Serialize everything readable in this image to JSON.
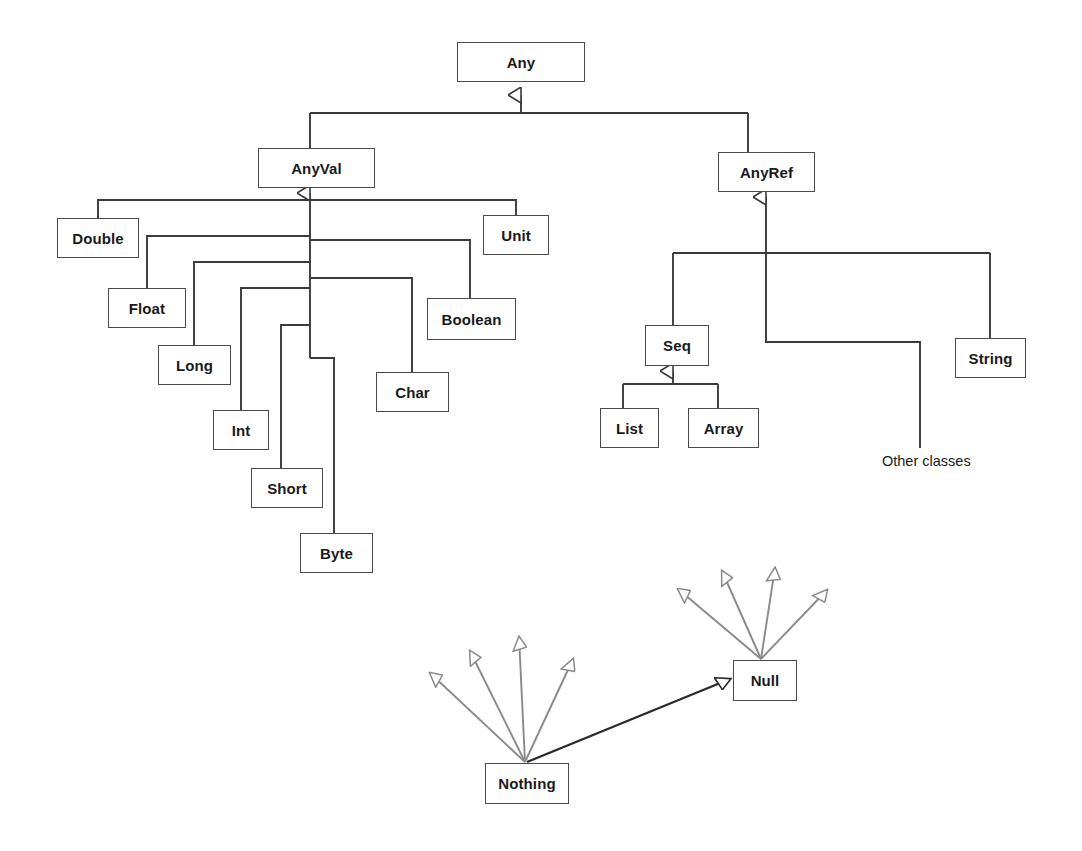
{
  "diagram": {
    "background_color": "#ffffff",
    "edge_color": "#3a3a3a",
    "subtype_edge_color": "#8a8a8a",
    "node_border_color": "#4a4a4a",
    "node_fill_color": "#ffffff",
    "text_color": "#1a1a1a"
  },
  "nodes": {
    "any": {
      "label": "Any",
      "x": 457,
      "y": 42,
      "w": 128,
      "h": 40
    },
    "anyval": {
      "label": "AnyVal",
      "x": 258,
      "y": 148,
      "w": 117,
      "h": 40
    },
    "anyref": {
      "label": "AnyRef",
      "x": 718,
      "y": 152,
      "w": 97,
      "h": 40
    },
    "double": {
      "label": "Double",
      "x": 57,
      "y": 218,
      "w": 82,
      "h": 40
    },
    "float": {
      "label": "Float",
      "x": 108,
      "y": 288,
      "w": 78,
      "h": 40
    },
    "long": {
      "label": "Long",
      "x": 158,
      "y": 345,
      "w": 73,
      "h": 40
    },
    "int": {
      "label": "Int",
      "x": 213,
      "y": 410,
      "w": 56,
      "h": 40
    },
    "short": {
      "label": "Short",
      "x": 251,
      "y": 468,
      "w": 72,
      "h": 40
    },
    "byte": {
      "label": "Byte",
      "x": 300,
      "y": 533,
      "w": 73,
      "h": 40
    },
    "char": {
      "label": "Char",
      "x": 376,
      "y": 372,
      "w": 73,
      "h": 40
    },
    "boolean": {
      "label": "Boolean",
      "x": 427,
      "y": 298,
      "w": 89,
      "h": 42
    },
    "unit": {
      "label": "Unit",
      "x": 483,
      "y": 215,
      "w": 66,
      "h": 40
    },
    "seq": {
      "label": "Seq",
      "x": 645,
      "y": 325,
      "w": 64,
      "h": 41
    },
    "list": {
      "label": "List",
      "x": 600,
      "y": 408,
      "w": 59,
      "h": 40
    },
    "array": {
      "label": "Array",
      "x": 688,
      "y": 408,
      "w": 71,
      "h": 40
    },
    "string": {
      "label": "String",
      "x": 955,
      "y": 338,
      "w": 71,
      "h": 40
    },
    "null": {
      "label": "Null",
      "x": 733,
      "y": 660,
      "w": 64,
      "h": 41
    },
    "nothing": {
      "label": "Nothing",
      "x": 485,
      "y": 763,
      "w": 84,
      "h": 41
    }
  },
  "labels": {
    "other_classes": {
      "text": "Other classes",
      "x": 882,
      "y": 453
    }
  },
  "hierarchy": {
    "root": "Any",
    "edges": [
      {
        "from": "AnyVal",
        "to": "Any",
        "kind": "extends"
      },
      {
        "from": "AnyRef",
        "to": "Any",
        "kind": "extends"
      },
      {
        "from": "Double",
        "to": "AnyVal",
        "kind": "extends"
      },
      {
        "from": "Float",
        "to": "AnyVal",
        "kind": "extends"
      },
      {
        "from": "Long",
        "to": "AnyVal",
        "kind": "extends"
      },
      {
        "from": "Int",
        "to": "AnyVal",
        "kind": "extends"
      },
      {
        "from": "Short",
        "to": "AnyVal",
        "kind": "extends"
      },
      {
        "from": "Byte",
        "to": "AnyVal",
        "kind": "extends"
      },
      {
        "from": "Char",
        "to": "AnyVal",
        "kind": "extends"
      },
      {
        "from": "Boolean",
        "to": "AnyVal",
        "kind": "extends"
      },
      {
        "from": "Unit",
        "to": "AnyVal",
        "kind": "extends"
      },
      {
        "from": "Seq",
        "to": "AnyRef",
        "kind": "extends"
      },
      {
        "from": "String",
        "to": "AnyRef",
        "kind": "extends"
      },
      {
        "from": "Other classes",
        "to": "AnyRef",
        "kind": "extends"
      },
      {
        "from": "List",
        "to": "Seq",
        "kind": "extends"
      },
      {
        "from": "Array",
        "to": "Seq",
        "kind": "extends"
      },
      {
        "from": "Nothing",
        "to": "Null",
        "kind": "subtype"
      },
      {
        "from": "Null",
        "to": "all reference types",
        "kind": "subtype-fan",
        "count": 4
      },
      {
        "from": "Nothing",
        "to": "all types",
        "kind": "subtype-fan",
        "count": 4
      }
    ]
  }
}
